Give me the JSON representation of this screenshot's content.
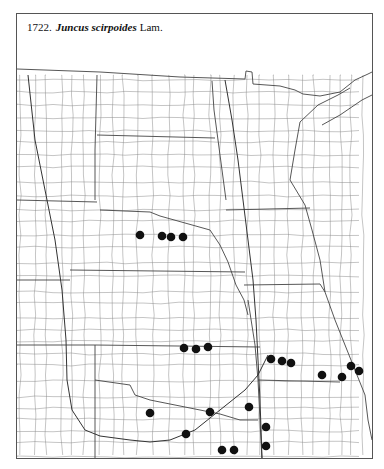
{
  "caption": {
    "number": "1722.",
    "species": "Juncus scirpoides",
    "author": "Lam."
  },
  "map": {
    "description": "County outline distribution map of the central United States",
    "dot_color": "#111111",
    "line_color": "#6a6a6a",
    "dots": [
      {
        "x": 140,
        "y": 235
      },
      {
        "x": 162,
        "y": 236
      },
      {
        "x": 171,
        "y": 237
      },
      {
        "x": 183,
        "y": 237
      },
      {
        "x": 184,
        "y": 348
      },
      {
        "x": 196,
        "y": 349
      },
      {
        "x": 208,
        "y": 347
      },
      {
        "x": 271,
        "y": 359
      },
      {
        "x": 282,
        "y": 361
      },
      {
        "x": 291,
        "y": 363
      },
      {
        "x": 322,
        "y": 375
      },
      {
        "x": 342,
        "y": 377
      },
      {
        "x": 351,
        "y": 366
      },
      {
        "x": 359,
        "y": 371
      },
      {
        "x": 249,
        "y": 407
      },
      {
        "x": 210,
        "y": 412
      },
      {
        "x": 150,
        "y": 413
      },
      {
        "x": 266,
        "y": 427
      },
      {
        "x": 186,
        "y": 434
      },
      {
        "x": 266,
        "y": 446
      },
      {
        "x": 222,
        "y": 450
      },
      {
        "x": 234,
        "y": 450
      }
    ]
  }
}
